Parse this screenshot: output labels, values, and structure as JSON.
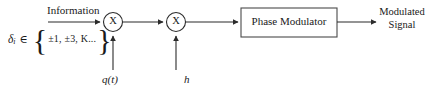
{
  "diagram": {
    "type": "block-diagram",
    "colors": {
      "line": "#2b2b2b",
      "text": "#1a1a1a",
      "background": "#ffffff"
    },
    "inputs": {
      "information_label": "Information",
      "symbol_alphabet": {
        "variable": "δ",
        "subscript": "i",
        "member_of": "∈",
        "brace_left": "{",
        "items": "±1, ±3, K...",
        "brace_right": "}"
      },
      "pulse_shape_label": "q(t)",
      "modulation_index_label": "h"
    },
    "blocks": {
      "multiplier_1": "X",
      "multiplier_2": "X",
      "phase_modulator": "Phase Modulator"
    },
    "output": {
      "label_line1": "Modulated",
      "label_line2": "Signal"
    }
  }
}
